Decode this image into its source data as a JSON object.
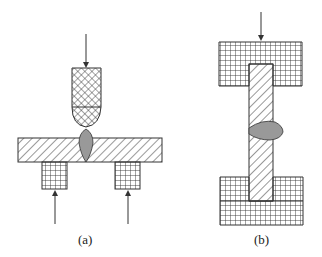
{
  "figure": {
    "panel_a": {
      "label": "(a)",
      "description": "Electrode pressing on horizontal plate supported by two blocks; weld nugget at center"
    },
    "panel_b": {
      "label": "(b)",
      "description": "Vertical bar clamped between top and bottom blocks; weld nugget on side"
    },
    "colors": {
      "line": "#333333",
      "nugget": "#999999",
      "background": "#ffffff"
    }
  }
}
